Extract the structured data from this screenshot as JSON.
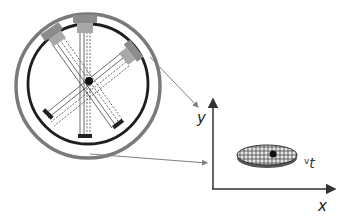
{
  "diagram": {
    "type": "tomography-scanner-schematic",
    "scanner": {
      "outer_ring_color": "#7a7a7a",
      "inner_ring_color": "#1e1e1e",
      "source_color": "#8c8c8c",
      "beam_count": 3,
      "center_marker_color": "#111111"
    },
    "plot": {
      "y_axis_label": "y",
      "x_axis_label": "x",
      "object_label_prefix": "v",
      "object_label_main": "t",
      "object_fill": "#d8d8d8",
      "object_grid_color": "#333333",
      "marker_color": "#111111"
    },
    "connectors": {
      "color": "#7f7f7f",
      "count": 2
    }
  }
}
